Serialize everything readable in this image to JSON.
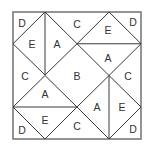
{
  "diagram": {
    "type": "quilt-block-pattern",
    "square": {
      "x": 13,
      "y": 12,
      "size": 128
    },
    "colors": {
      "line": "#3a3a3a",
      "border": "#7a7a7a",
      "text": "#333333",
      "background": "#ffffff"
    },
    "lines": [
      [
        45,
        12,
        45,
        75
      ],
      [
        45,
        12,
        13,
        43.75
      ],
      [
        13,
        43.75,
        45,
        75
      ],
      [
        45,
        12,
        77,
        43.75
      ],
      [
        77,
        43.75,
        45,
        75
      ],
      [
        77,
        43.75,
        141,
        43.75
      ],
      [
        109,
        12,
        77,
        43.75
      ],
      [
        109,
        12,
        141,
        43.75
      ],
      [
        77,
        43.75,
        109,
        75.5
      ],
      [
        141,
        43.75,
        109,
        75.5
      ],
      [
        13,
        107,
        77,
        107
      ],
      [
        13,
        107,
        45,
        75.5
      ],
      [
        45,
        75.5,
        77,
        107
      ],
      [
        13,
        107,
        45,
        139
      ],
      [
        45,
        139,
        77,
        107
      ],
      [
        109,
        75.5,
        109,
        139
      ],
      [
        109,
        75.5,
        77,
        107
      ],
      [
        77,
        107,
        109,
        139
      ],
      [
        109,
        75.5,
        141,
        107
      ],
      [
        141,
        107,
        109,
        139
      ]
    ],
    "regions": [
      {
        "id": "d-top-left",
        "label": "D",
        "x": 22,
        "y": 23
      },
      {
        "id": "e-top-left",
        "label": "E",
        "x": 32,
        "y": 44
      },
      {
        "id": "a-top-left",
        "label": "A",
        "x": 57,
        "y": 44
      },
      {
        "id": "c-top",
        "label": "C",
        "x": 77,
        "y": 24
      },
      {
        "id": "e-top-right",
        "label": "E",
        "x": 108,
        "y": 30
      },
      {
        "id": "d-top-right",
        "label": "D",
        "x": 133,
        "y": 22
      },
      {
        "id": "a-top-right",
        "label": "A",
        "x": 108,
        "y": 58
      },
      {
        "id": "c-left",
        "label": "C",
        "x": 25,
        "y": 76
      },
      {
        "id": "b-center",
        "label": "B",
        "x": 77,
        "y": 76
      },
      {
        "id": "c-right",
        "label": "C",
        "x": 128,
        "y": 76
      },
      {
        "id": "a-bottom-left",
        "label": "A",
        "x": 45,
        "y": 94
      },
      {
        "id": "a-bottom-right",
        "label": "A",
        "x": 97,
        "y": 107
      },
      {
        "id": "e-bottom-right",
        "label": "E",
        "x": 122,
        "y": 107
      },
      {
        "id": "e-bottom-left",
        "label": "E",
        "x": 45,
        "y": 120
      },
      {
        "id": "c-bottom",
        "label": "C",
        "x": 77,
        "y": 126
      },
      {
        "id": "d-bottom-left",
        "label": "D",
        "x": 22,
        "y": 130
      },
      {
        "id": "d-bottom-right",
        "label": "D",
        "x": 133,
        "y": 129
      }
    ]
  }
}
